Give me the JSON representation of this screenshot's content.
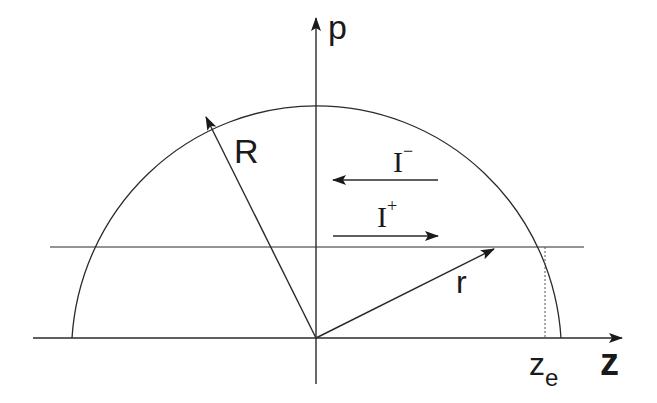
{
  "diagram": {
    "axes": {
      "vertical_label": "p",
      "horizontal_label": "z"
    },
    "vectors": {
      "big_radius_label": "R",
      "small_radius_label": "r"
    },
    "currents": {
      "minus": {
        "base": "I",
        "sup": "−"
      },
      "plus": {
        "base": "I",
        "sup": "+"
      }
    },
    "endpoint": {
      "base": "z",
      "sub": "e"
    },
    "colors": {
      "ink": "#1a1a1a",
      "background": "#ffffff"
    }
  }
}
